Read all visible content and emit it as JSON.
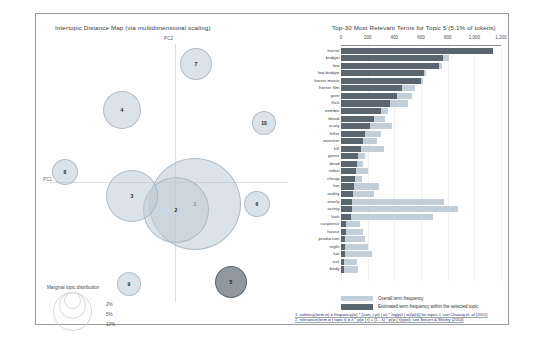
{
  "left_panel": {
    "title": "Intertopic Distance Map (via multidimensional scaling)",
    "axis_x_label": "PC1",
    "axis_y_label": "PC2",
    "legend": {
      "title": "Marginal topic distribution",
      "sizes": [
        "2%",
        "5%",
        "10%"
      ]
    },
    "topics": [
      {
        "id": "1",
        "x": 159,
        "y": 190,
        "r": 46,
        "selected": false
      },
      {
        "id": "2",
        "x": 140,
        "y": 196,
        "r": 33,
        "selected": false
      },
      {
        "id": "3",
        "x": 96,
        "y": 182,
        "r": 26,
        "selected": false
      },
      {
        "id": "4",
        "x": 86,
        "y": 96,
        "r": 19,
        "selected": false
      },
      {
        "id": "5",
        "x": 195,
        "y": 268,
        "r": 16,
        "selected": true
      },
      {
        "id": "6",
        "x": 221,
        "y": 190,
        "r": 13,
        "selected": false
      },
      {
        "id": "7",
        "x": 160,
        "y": 50,
        "r": 16,
        "selected": false
      },
      {
        "id": "8",
        "x": 29,
        "y": 158,
        "r": 13,
        "selected": false
      },
      {
        "id": "9",
        "x": 93,
        "y": 270,
        "r": 12,
        "selected": false
      },
      {
        "id": "10",
        "x": 228,
        "y": 109,
        "r": 12,
        "selected": false
      }
    ]
  },
  "right_panel": {
    "title": "Top-30 Most Relevant Terms for Topic 5 (5.1% of tokens)",
    "legend": [
      {
        "key": "total",
        "label": "Overall term frequency",
        "color": "#c3cedb"
      },
      {
        "key": "estimated",
        "label": "Estimated term frequency within the selected topic",
        "color": "#5a6570"
      }
    ],
    "footnotes": [
      "1. saliency(term w) = frequency(w) * [sum_t p(t | w) * log(p(t | w)/p(t))] for topics t; see Chuang et. al (2012)",
      "2. relevance(term w | topic t) = λ * p(w | t) + (1 - λ) * p(w | t)/p(w); see Sievert & Shirley (2014)"
    ]
  },
  "chart_data": {
    "type": "bar",
    "title": "Top-30 Most Relevant Terms for Topic 5 (5.1% of tokens)",
    "xlabel": "",
    "ylabel": "",
    "xlim": [
      0,
      1200
    ],
    "ticks": [
      "0",
      "200",
      "400",
      "600",
      "800",
      "1,000",
      "1,200"
    ],
    "tick_values": [
      0,
      200,
      400,
      600,
      800,
      1000,
      1200
    ],
    "grid": true,
    "orientation": "horizontal",
    "legend_position": "bottom",
    "categories": [
      "horror",
      "budget",
      "low",
      "low budget",
      "horror movie",
      "horror film",
      "gore",
      "flick",
      "zombie",
      "blood",
      "scary",
      "killer",
      "monster",
      "kill",
      "genre",
      "dead",
      "video",
      "cheap",
      "fan",
      "nudity",
      "overly",
      "acting",
      "look",
      "suspense",
      "house",
      "production",
      "night",
      "fun",
      "evil",
      "body"
    ],
    "series": [
      {
        "name": "Overall term frequency",
        "values": [
          1140,
          810,
          760,
          640,
          615,
          555,
          535,
          505,
          350,
          330,
          380,
          300,
          270,
          320,
          180,
          165,
          200,
          155,
          285,
          250,
          770,
          880,
          690,
          140,
          165,
          180,
          200,
          230,
          120,
          130
        ]
      },
      {
        "name": "Estimated term frequency within the selected topic",
        "values": [
          1140,
          765,
          735,
          620,
          600,
          455,
          420,
          370,
          300,
          250,
          215,
          180,
          165,
          150,
          130,
          120,
          112,
          105,
          98,
          92,
          85,
          80,
          72,
          38,
          35,
          33,
          30,
          28,
          25,
          22
        ]
      }
    ]
  }
}
